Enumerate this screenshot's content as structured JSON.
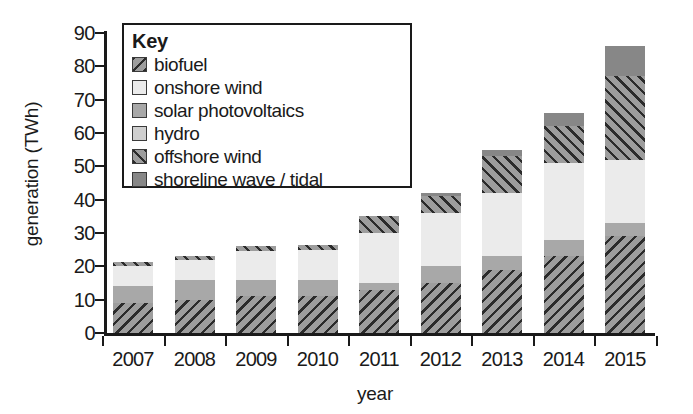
{
  "chart_data": {
    "type": "bar",
    "stacked": true,
    "title": "",
    "xlabel": "year",
    "ylabel": "generation (TWh)",
    "ylim": [
      0,
      90
    ],
    "yticks": [
      0,
      10,
      20,
      30,
      40,
      50,
      60,
      70,
      80,
      90
    ],
    "ytick_labels": [
      "0",
      "10",
      "20",
      "30",
      "40",
      "50",
      "60",
      "70",
      "80",
      "90"
    ],
    "grid": false,
    "legend_position": "upper-left-inset",
    "legend_title": "Key",
    "categories": [
      "2007",
      "2008",
      "2009",
      "2010",
      "2011",
      "2012",
      "2013",
      "2014",
      "2015"
    ],
    "series": [
      {
        "name": "biofuel",
        "pattern": "diagonal-hatch-backward",
        "color": "#9d9d9d",
        "values": [
          9,
          10,
          11,
          11,
          13,
          15,
          19,
          23,
          29
        ]
      },
      {
        "name": "solar photovoltaics",
        "pattern": "solid-mid-grey",
        "color": "#a8a8a8",
        "values": [
          5,
          6,
          5,
          5,
          2,
          5,
          4,
          5,
          4
        ]
      },
      {
        "name": "onshore wind",
        "pattern": "solid-light",
        "color": "#ebebeb",
        "values": [
          6,
          6,
          8.5,
          9,
          15,
          16,
          19,
          23,
          19
        ]
      },
      {
        "name": "offshore wind",
        "pattern": "diagonal-hatch-forward",
        "color": "#9d9d9d",
        "values": [
          1.3,
          1,
          1.5,
          1.5,
          5,
          5,
          11,
          11,
          25
        ]
      },
      {
        "name": "shoreline wave / tidal",
        "pattern": "solid-dark",
        "color": "#878787",
        "values": [
          0,
          0,
          0,
          0,
          0,
          1,
          2,
          4,
          9
        ]
      },
      {
        "name": "hydro",
        "pattern": "solid-pale",
        "color": "#cfcfcf",
        "values": [
          0,
          0,
          0,
          0,
          0,
          0,
          0,
          0,
          0
        ]
      }
    ],
    "totals": [
      21.3,
      23,
      26,
      26.5,
      35,
      42,
      55,
      66,
      86
    ]
  },
  "legend": {
    "title": "Key",
    "items": [
      {
        "label": "biofuel",
        "swatch": "hatch-back-swatch"
      },
      {
        "label": "onshore wind",
        "swatch": "light-swatch"
      },
      {
        "label": "solar photovoltaics",
        "swatch": "mid-grey-swatch"
      },
      {
        "label": "hydro",
        "swatch": "pale-swatch"
      },
      {
        "label": "offshore wind",
        "swatch": "hatch-forward-swatch"
      },
      {
        "label": "shoreline wave / tidal",
        "swatch": "dark-swatch"
      }
    ]
  },
  "axes": {
    "x_title": "year",
    "y_title": "generation (TWh)"
  },
  "colors": {
    "biofuel": "#9d9d9d",
    "onshore_wind": "#ebebeb",
    "solar": "#a8a8a8",
    "hydro": "#cfcfcf",
    "offshore_wind": "#9d9d9d",
    "shoreline": "#878787",
    "ink": "#1a1a1a"
  }
}
